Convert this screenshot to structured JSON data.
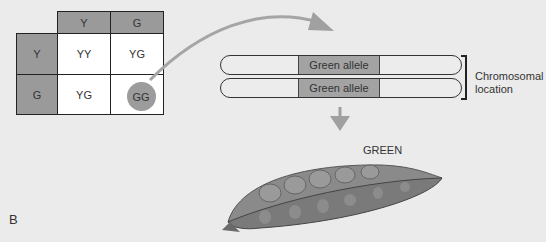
{
  "punnett": {
    "col_headers": [
      "Y",
      "G"
    ],
    "row_headers": [
      "Y",
      "G"
    ],
    "cells": [
      [
        "YY",
        "YG"
      ],
      [
        "YG",
        "GG"
      ]
    ],
    "highlighted_cell": "GG"
  },
  "chromosomes": [
    {
      "band_label": "Green allele"
    },
    {
      "band_label": "Green allele"
    }
  ],
  "bracket_label_line1": "Chromosomal",
  "bracket_label_line2": "location",
  "phenotype_label": "GREEN",
  "panel_label": "B",
  "colors": {
    "background": "#ebebeb",
    "header_fill": "#9a9a9a",
    "band_fill": "#a3a3a3",
    "arrow": "#a0a0a0",
    "pod": "#7d7d7d"
  }
}
